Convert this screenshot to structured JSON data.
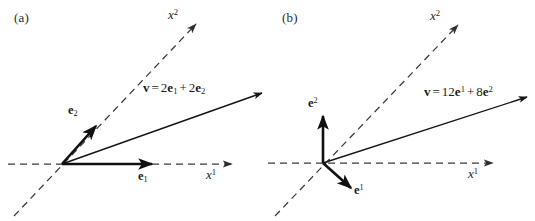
{
  "figure": {
    "background_color": "#ffffff",
    "stroke_color": "#1c1c1c",
    "dash_color": "#3a3a3a",
    "width": 535,
    "height": 221
  },
  "panels": [
    {
      "id": "a",
      "label": "(a)",
      "origin": {
        "x": 62,
        "y": 164
      },
      "axes": [
        {
          "name": "x1",
          "label_base": "x",
          "label_sup": "1",
          "style": "dashed",
          "from": {
            "x": 8,
            "y": 164
          },
          "to": {
            "x": 232,
            "y": 164
          },
          "label_pos": {
            "x": 206,
            "y": 172
          }
        },
        {
          "name": "x2",
          "label_base": "x",
          "label_sup": "2",
          "style": "dashed",
          "from": {
            "x": 14,
            "y": 216
          },
          "to": {
            "x": 196,
            "y": 24
          },
          "label_pos": {
            "x": 168,
            "y": 8
          }
        }
      ],
      "basis_vectors": [
        {
          "name": "e1",
          "label_base": "e",
          "label_sub": "1",
          "from": {
            "x": 62,
            "y": 164
          },
          "to": {
            "x": 152,
            "y": 164
          },
          "label_pos": {
            "x": 139,
            "y": 172
          }
        },
        {
          "name": "e2",
          "label_base": "e",
          "label_sub": "2",
          "from": {
            "x": 62,
            "y": 164
          },
          "to": {
            "x": 96,
            "y": 126
          },
          "label_pos": {
            "x": 71,
            "y": 107
          }
        }
      ],
      "vector": {
        "name": "v",
        "from": {
          "x": 62,
          "y": 164
        },
        "to": {
          "x": 262,
          "y": 93
        },
        "equation": {
          "symbol": "v",
          "equals": "=",
          "terms": [
            {
              "coefficient": "2",
              "base": "e",
              "sub": "1"
            },
            {
              "coefficient": "2",
              "base": "e",
              "sub": "2"
            }
          ],
          "plus": "+",
          "plain_text": "v = 2e1 + 2e2"
        },
        "label_pos": {
          "x": 146,
          "y": 82
        }
      }
    },
    {
      "id": "b",
      "label": "(b)",
      "origin": {
        "x": 55,
        "y": 163
      },
      "axes": [
        {
          "name": "x1",
          "label_base": "x",
          "label_sup": "1",
          "style": "dashed",
          "from": {
            "x": 0,
            "y": 163
          },
          "to": {
            "x": 225,
            "y": 163
          },
          "label_pos": {
            "x": 200,
            "y": 171
          }
        },
        {
          "name": "x2",
          "label_base": "x",
          "label_sup": "2",
          "style": "dashed",
          "from": {
            "x": 7,
            "y": 216
          },
          "to": {
            "x": 190,
            "y": 25
          },
          "label_pos": {
            "x": 162,
            "y": 9
          }
        }
      ],
      "basis_vectors": [
        {
          "name": "e1",
          "label_base": "e",
          "label_sup": "1",
          "from": {
            "x": 55,
            "y": 163
          },
          "to": {
            "x": 83,
            "y": 188
          },
          "label_pos": {
            "x": 86,
            "y": 186
          }
        },
        {
          "name": "e2",
          "label_base": "e",
          "label_sup": "2",
          "from": {
            "x": 55,
            "y": 163
          },
          "to": {
            "x": 55,
            "y": 116
          },
          "label_pos": {
            "x": 42,
            "y": 100
          }
        }
      ],
      "vector": {
        "name": "v",
        "from": {
          "x": 55,
          "y": 163
        },
        "to": {
          "x": 259,
          "y": 97
        },
        "equation": {
          "symbol": "v",
          "equals": "=",
          "terms": [
            {
              "coefficient": "12",
              "base": "e",
              "sup": "1"
            },
            {
              "coefficient": "8",
              "base": "e",
              "sup": "2"
            }
          ],
          "plus": "+",
          "plain_text": "v = 12e^1 + 8e^2"
        },
        "label_pos": {
          "x": 159,
          "y": 86
        }
      }
    }
  ]
}
